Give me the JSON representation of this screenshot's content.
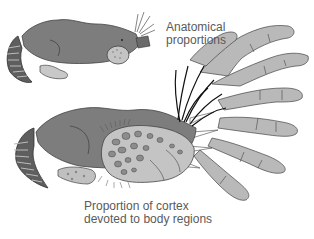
{
  "figure": {
    "type": "scientific-illustration",
    "labels": {
      "top": [
        "Anatomical",
        "proportions"
      ],
      "bottom": [
        "Proportion of cortex",
        "devoted to body regions"
      ]
    },
    "colors": {
      "body": "#7d7d7d",
      "limb": "#b4b4b4",
      "hand": "#b9b9b9",
      "outline": "#3a3a3a",
      "text": "#5a5a5a",
      "background": "#ffffff"
    }
  }
}
